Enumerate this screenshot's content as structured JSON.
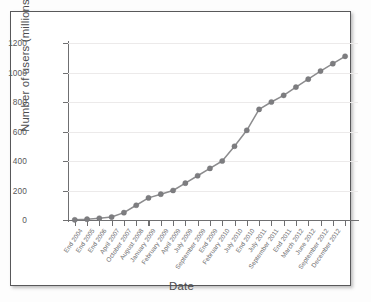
{
  "chart_data": {
    "type": "line",
    "title": "",
    "xlabel": "Date",
    "ylabel": "Number of users (millions)",
    "ylim": [
      0,
      1200
    ],
    "yticks": [
      0,
      200,
      400,
      600,
      800,
      1000,
      1200
    ],
    "ytick_labels": [
      "0",
      "200",
      "400",
      "600",
      "800",
      "1000",
      "1200"
    ],
    "grid": true,
    "legend": "none",
    "marker": "circle",
    "line_color": "#8c8c8e",
    "marker_color": "#7d7d80",
    "categories": [
      "End 2004",
      "End 2005",
      "End 2006",
      "April 2007",
      "October 2007",
      "August 2008",
      "January 2009",
      "February 2009",
      "April 2009",
      "July 2009",
      "September 2009",
      "End 2009",
      "February 2010",
      "July 2010",
      "End 2010",
      "July 2011",
      "September 2011",
      "End 2011",
      "March 2012",
      "June 2012",
      "September 2012",
      "December 2012"
    ],
    "values": [
      1,
      5.5,
      12,
      20,
      50,
      100,
      150,
      175,
      200,
      250,
      300,
      350,
      400,
      500,
      608,
      750,
      800,
      845,
      901,
      955,
      1010,
      1060
    ],
    "extra_points": {
      "note": "final tail point",
      "value": 1110
    }
  },
  "axis": {
    "x_title": "Date",
    "y_title": "Number of users (millions)"
  }
}
